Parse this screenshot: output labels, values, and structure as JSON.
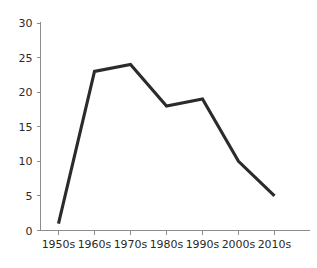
{
  "chart_data": {
    "type": "line",
    "title": "",
    "subtitle": "",
    "xlabel": "",
    "ylabel": "",
    "categories": [
      "1950s",
      "1960s",
      "1970s",
      "1980s",
      "1990s",
      "2000s",
      "2010s"
    ],
    "values": [
      1,
      23,
      24,
      18,
      19,
      10,
      5
    ],
    "series": [
      {
        "name": "",
        "values": [
          1,
          23,
          24,
          18,
          19,
          10,
          5
        ]
      }
    ],
    "ylim": [
      0,
      30
    ],
    "y_ticks": [
      0,
      5,
      10,
      15,
      20,
      25,
      30
    ],
    "y_tick_labels": [
      "0",
      "5",
      "10",
      "15",
      "20",
      "25",
      "30"
    ],
    "x_tick_labels": [
      "1950s",
      "1960s",
      "1970s",
      "1980s",
      "1990s",
      "2000s",
      "2010s"
    ],
    "grid": false,
    "legend": false,
    "legend_position": "none",
    "annotations": [],
    "colors": {
      "line": "#2b2b2b",
      "axis": "#8c8c8c",
      "text": "#2a2a2a",
      "background": "#ffffff"
    }
  }
}
